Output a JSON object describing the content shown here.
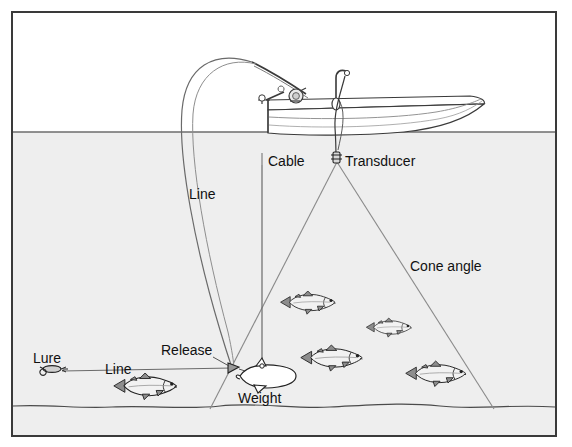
{
  "figure": {
    "kind": "technical-illustration"
  },
  "colors": {
    "page_background": "#ffffff",
    "frame_border": "#3a3a3a",
    "air_fill": "#ffffff",
    "water_fill": "#eeeeee",
    "line_stroke": "#5a5a5a",
    "ink_stroke": "#222222",
    "fish_fill": "#f2f2f2",
    "fish_shade": "#8d8d8d",
    "label_text": "#111111"
  },
  "frame": {
    "x": 11,
    "y": 11,
    "width": 546,
    "height": 426,
    "stroke_width": 2
  },
  "scene": {
    "water_surface_y": 132,
    "lake_bed_y": 407,
    "transducer_apex": {
      "x": 337,
      "y": 162
    },
    "cone_left_end": {
      "x": 210,
      "y": 409
    },
    "cone_right_end": {
      "x": 494,
      "y": 409
    },
    "cone_angle_degrees_implied": 54
  },
  "labels": [
    {
      "id": "cable",
      "text": "Cable",
      "x": 268,
      "y": 166,
      "anchor": "start"
    },
    {
      "id": "transducer",
      "text": "Transducer",
      "x": 345,
      "y": 166,
      "anchor": "start"
    },
    {
      "id": "line_upper",
      "text": "Line",
      "x": 189,
      "y": 199,
      "anchor": "start"
    },
    {
      "id": "cone_angle",
      "text": "Cone angle",
      "x": 410,
      "y": 271,
      "anchor": "start"
    },
    {
      "id": "lure",
      "text": "Lure",
      "x": 33,
      "y": 363,
      "anchor": "start"
    },
    {
      "id": "line_lower",
      "text": "Line",
      "x": 105,
      "y": 374,
      "anchor": "start"
    },
    {
      "id": "release",
      "text": "Release",
      "x": 161,
      "y": 355,
      "anchor": "start"
    },
    {
      "id": "weight",
      "text": "Weight",
      "x": 238,
      "y": 403,
      "anchor": "start"
    }
  ],
  "objects": {
    "boat": {
      "bow_x": 484,
      "stern_x": 268,
      "deck_y": 104,
      "hull_bottom_y": 133
    },
    "rod": {
      "tip_x": 252,
      "tip_y": 62,
      "butt_x": 312,
      "butt_y": 98,
      "reel_x": 297,
      "reel_y": 95
    },
    "cable": {
      "top_x": 336,
      "top_y": 75,
      "bottom_x": 336,
      "bottom_y": 158
    },
    "downrigger_weight": {
      "x": 263,
      "y": 377,
      "length": 56
    },
    "release_clip": {
      "x": 232,
      "y": 368
    },
    "lure": {
      "x": 50,
      "y": 369,
      "length": 20
    }
  },
  "fish": [
    {
      "id": "fish-bass-upper",
      "x": 312,
      "y": 307,
      "length": 56,
      "facing": "right"
    },
    {
      "id": "fish-trout-small",
      "x": 392,
      "y": 330,
      "length": 48,
      "facing": "right"
    },
    {
      "id": "fish-trout-mid",
      "x": 338,
      "y": 360,
      "length": 62,
      "facing": "right"
    },
    {
      "id": "fish-trout-right",
      "x": 442,
      "y": 375,
      "length": 62,
      "facing": "right"
    },
    {
      "id": "fish-target-left",
      "x": 155,
      "y": 387,
      "length": 66,
      "facing": "right"
    }
  ]
}
